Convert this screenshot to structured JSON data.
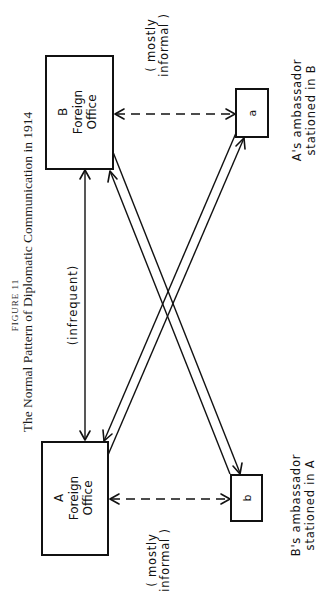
{
  "figure": {
    "number_label": "FIGURE 11",
    "title": "The Normal Pattern of Diplomatic Communication in 1914",
    "orientation": "rotated 90° counter-clockwise"
  },
  "nodes": {
    "b_foreign_office": {
      "letter": "B",
      "line1": "Foreign",
      "line2": "Office"
    },
    "a_foreign_office": {
      "letter": "A",
      "line1": "Foreign",
      "line2": "Office"
    },
    "a_ambassador": {
      "letter": "a",
      "caption_line1": "A's ambassador",
      "caption_line2": "stationed in B"
    },
    "b_ambassador": {
      "letter": "b",
      "caption_line1": "B's ambassador",
      "caption_line2": "stationed in A"
    }
  },
  "edges": {
    "foreign_offices": {
      "label": "(infrequent)",
      "style": "solid",
      "direction": "both"
    },
    "b_office_to_a_amb": {
      "label_line1": "( mostly",
      "label_line2": "informal )",
      "style": "dashed",
      "direction": "both"
    },
    "a_office_to_b_amb": {
      "label_line1": "( mostly",
      "label_line2": "informal )",
      "style": "dashed",
      "direction": "both"
    },
    "cross_links": [
      {
        "from": "B Foreign Office",
        "to": "b",
        "style": "solid"
      },
      {
        "from": "b",
        "to": "B Foreign Office",
        "style": "solid"
      },
      {
        "from": "A Foreign Office",
        "to": "a",
        "style": "solid"
      },
      {
        "from": "a",
        "to": "A Foreign Office",
        "style": "solid"
      }
    ]
  },
  "colors": {
    "ink": "#111111",
    "paper": "#ffffff"
  }
}
